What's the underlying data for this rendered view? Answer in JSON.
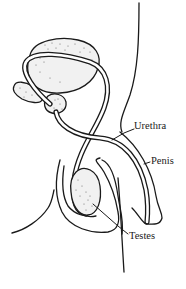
{
  "diagram": {
    "type": "anatomical line drawing",
    "labels": [
      {
        "id": "urethra",
        "text": "Urethra"
      },
      {
        "id": "penis",
        "text": "Penis"
      },
      {
        "id": "testes",
        "text": "Testes"
      }
    ],
    "colors": {
      "line": "#1a1a1a",
      "organ_fill": "#f1f1f1",
      "background": "#ffffff"
    }
  }
}
